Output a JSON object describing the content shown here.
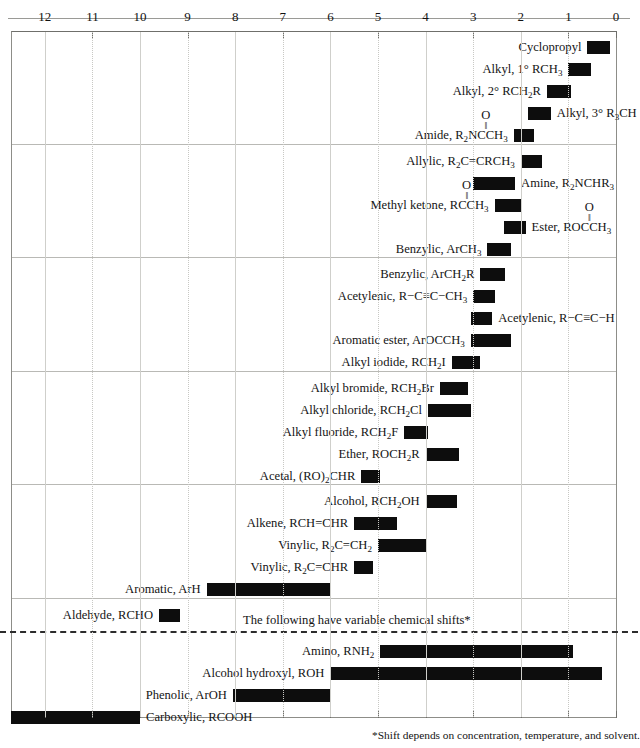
{
  "chart_data": {
    "type": "bar",
    "orientation": "horizontal-range",
    "xlabel": "Chemical shift (ppm)",
    "ylabel": "",
    "xlim": [
      12.7,
      0
    ],
    "axis_direction": "reversed",
    "ticks": [
      12,
      11,
      10,
      9,
      8,
      7,
      6,
      5,
      4,
      3,
      2,
      1,
      0
    ],
    "grid": true,
    "bar_color": "#0d0d0d",
    "variable_shift_note": "The following have variable chemical shifts*",
    "footnote": "*Shift depends on concentration, temperature, and solvent.",
    "sections": [
      {
        "rows": [
          {
            "label_html": "Cyclopropyl",
            "label_side": "left",
            "start": 0.6,
            "end": 0.13
          },
          {
            "label_html": "Alkyl, 1&deg; RCH<sub>3</sub>",
            "label_side": "left",
            "start": 1.0,
            "end": 0.52
          },
          {
            "label_html": "Alkyl, 2&deg; RCH<sub>2</sub>R",
            "label_side": "left",
            "start": 1.45,
            "end": 0.95
          },
          {
            "label_html": "Alkyl, 3&deg; R<sub>3</sub>CH",
            "label_side": "right",
            "start": 1.85,
            "end": 1.37
          },
          {
            "label_html": "Amide, R<sub>2</sub>NC&#8202;CH<sub>3</sub>",
            "label_side": "left",
            "start": 2.15,
            "end": 1.72,
            "carbonyl_after": "NC"
          }
        ]
      },
      {
        "rows": [
          {
            "label_html": "Allylic, R<sub>2</sub>C=CRCH<sub>3</sub>",
            "label_side": "left",
            "start": 2.0,
            "end": 1.55
          },
          {
            "label_html": "Amine, R<sub>2</sub>NCHR<sub>3</sub>",
            "label_side": "right",
            "start": 3.0,
            "end": 2.12
          },
          {
            "label_html": "Methyl ketone, RC&#8202;CH<sub>3</sub>",
            "label_side": "left",
            "start": 2.55,
            "end": 2.0,
            "carbonyl_after": "RC"
          },
          {
            "label_html": "Ester, ROC&#8202;CH<sub>3</sub>",
            "label_side": "right",
            "start": 2.35,
            "end": 1.9,
            "carbonyl_after": "ROC"
          },
          {
            "label_html": "Benzylic, ArCH<sub>3</sub>",
            "label_side": "left",
            "start": 2.7,
            "end": 2.2
          }
        ]
      },
      {
        "rows": [
          {
            "label_html": "Benzylic, ArCH<sub>2</sub>R",
            "label_side": "left",
            "start": 2.85,
            "end": 2.33
          },
          {
            "label_html": "Acetylenic, R&#8722;C&#8801;C&#8722;CH<sub>3</sub>",
            "label_side": "left",
            "start": 3.0,
            "end": 2.55
          },
          {
            "label_html": "Acetylenic, R&#8722;C&#8801;C&#8722;H",
            "label_side": "right",
            "start": 3.05,
            "end": 2.6
          },
          {
            "label_html": "Aromatic ester, ArOC&#8202;CH<sub>3</sub>",
            "label_side": "left",
            "start": 3.05,
            "end": 2.2
          },
          {
            "label_html": "Alkyl iodide, RCH<sub>2</sub>I",
            "label_side": "left",
            "start": 3.45,
            "end": 2.85
          }
        ]
      },
      {
        "rows": [
          {
            "label_html": "Alkyl bromide, RCH<sub>2</sub>Br",
            "label_side": "left",
            "start": 3.7,
            "end": 3.1
          },
          {
            "label_html": "Alkyl chloride, RCH<sub>2</sub>Cl",
            "label_side": "left",
            "start": 3.95,
            "end": 3.05
          },
          {
            "label_html": "Alkyl fluoride, RCH<sub>2</sub>F",
            "label_side": "left",
            "start": 4.45,
            "end": 3.95
          },
          {
            "label_html": "Ether, ROCH<sub>2</sub>R",
            "label_side": "left",
            "start": 4.0,
            "end": 3.3
          },
          {
            "label_html": "Acetal, (RO)<sub>2</sub>CHR",
            "label_side": "left",
            "start": 5.35,
            "end": 4.95
          }
        ]
      },
      {
        "rows": [
          {
            "label_html": "Alcohol, RCH<sub>2</sub>OH",
            "label_side": "left",
            "start": 4.0,
            "end": 3.35
          },
          {
            "label_html": "Alkene, RCH=CHR",
            "label_side": "left",
            "start": 5.5,
            "end": 4.6
          },
          {
            "label_html": "Vinylic, R<sub>2</sub>C=CH<sub>2</sub>",
            "label_side": "left",
            "start": 5.0,
            "end": 4.0
          },
          {
            "label_html": "Vinylic, R<sub>2</sub>C=CHR",
            "label_side": "left",
            "start": 5.5,
            "end": 5.1
          },
          {
            "label_html": "Aromatic, ArH",
            "label_side": "left",
            "start": 8.6,
            "end": 6.0
          }
        ]
      },
      {
        "rows": [
          {
            "label_html": "Aldehyde, RCHO",
            "label_side": "left",
            "start": 9.6,
            "end": 9.15
          }
        ]
      },
      {
        "variable": true,
        "rows": [
          {
            "label_html": "Amino, RNH<sub>2</sub>",
            "label_side": "left",
            "start": 4.95,
            "end": 0.9
          },
          {
            "label_html": "Alcohol hydroxyl, ROH",
            "label_side": "left",
            "start": 6.0,
            "end": 0.3
          },
          {
            "label_html": "Phenolic, ArOH",
            "label_side": "left",
            "start": 8.05,
            "end": 6.0
          },
          {
            "label_html": "Carboxylic, RCOOH",
            "label_side": "right",
            "start": 12.72,
            "end": 10.0
          }
        ]
      }
    ]
  }
}
